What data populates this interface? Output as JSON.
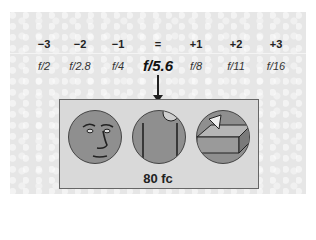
{
  "stops": [
    "−3",
    "−2",
    "−1",
    "=",
    "+1",
    "+2",
    "+3"
  ],
  "fnumbers": [
    "f/2",
    "f/2.8",
    "f/4",
    "f/5.6",
    "f/8",
    "f/11",
    "f/16"
  ],
  "selected_fnumber": "f/5.6",
  "scenes": [
    {
      "name": "face"
    },
    {
      "name": "door"
    },
    {
      "name": "block"
    }
  ],
  "illuminance_label": "80 fc",
  "colors": {
    "background": "#e6e6e6",
    "box": "#d9d9d9",
    "circle_fill": "#8f8f8f",
    "text": "#222222"
  }
}
